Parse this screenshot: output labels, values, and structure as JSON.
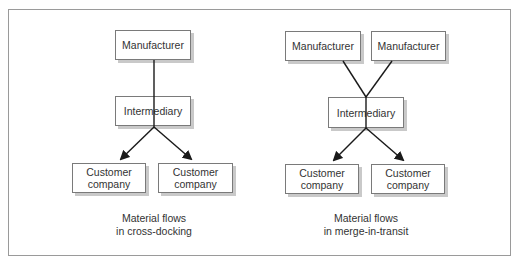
{
  "diagram": {
    "panels": [
      {
        "id": "cross-docking",
        "nodes": {
          "manufacturer": "Manufacturer",
          "intermediary": "Intermediary",
          "customer_left": "Customer company",
          "customer_right": "Customer company"
        },
        "caption_line1": "Material flows",
        "caption_line2": "in cross-docking"
      },
      {
        "id": "merge-in-transit",
        "nodes": {
          "manufacturer_left": "Manufacturer",
          "manufacturer_right": "Manufacturer",
          "intermediary": "Intermediary",
          "customer_left": "Customer company",
          "customer_right": "Customer company"
        },
        "caption_line1": "Material flows",
        "caption_line2": "in merge-in-transit"
      }
    ],
    "edges": [
      {
        "panel": "cross-docking",
        "from": "Manufacturer",
        "to": "Intermediary",
        "arrow": false
      },
      {
        "panel": "cross-docking",
        "from": "Intermediary",
        "to": "Customer company (left)",
        "arrow": true
      },
      {
        "panel": "cross-docking",
        "from": "Intermediary",
        "to": "Customer company (right)",
        "arrow": true
      },
      {
        "panel": "merge-in-transit",
        "from": "Manufacturer (left)",
        "to": "Intermediary",
        "arrow": false
      },
      {
        "panel": "merge-in-transit",
        "from": "Manufacturer (right)",
        "to": "Intermediary",
        "arrow": false
      },
      {
        "panel": "merge-in-transit",
        "from": "Intermediary",
        "to": "Customer company (left)",
        "arrow": true
      },
      {
        "panel": "merge-in-transit",
        "from": "Intermediary",
        "to": "Customer company (right)",
        "arrow": true
      }
    ],
    "colors": {
      "border": "#7a7a7a",
      "shadow": "#c9c9c9",
      "line": "#1a1a1a",
      "frame": "#9a9a9a",
      "text": "#333333"
    }
  }
}
